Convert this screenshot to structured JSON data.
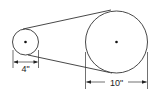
{
  "diagram": {
    "small_pulley": {
      "diameter_label": "4\""
    },
    "large_pulley": {
      "diameter_label": "10\""
    },
    "colors": {
      "stroke": "#222222",
      "background": "#ffffff"
    }
  }
}
